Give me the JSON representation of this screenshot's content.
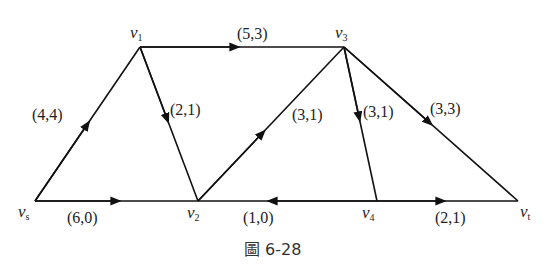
{
  "diagram": {
    "type": "network-flow",
    "caption": "圖 6-28",
    "nodes": [
      {
        "id": "vs",
        "name": "v",
        "sub": "s",
        "x": 35,
        "y": 201
      },
      {
        "id": "v1",
        "name": "v",
        "sub": "1",
        "x": 140,
        "y": 47
      },
      {
        "id": "v2",
        "name": "v",
        "sub": "2",
        "x": 198,
        "y": 201
      },
      {
        "id": "v3",
        "name": "v",
        "sub": "3",
        "x": 344,
        "y": 47
      },
      {
        "id": "v4",
        "name": "v",
        "sub": "4",
        "x": 377,
        "y": 201
      },
      {
        "id": "vt",
        "name": "v",
        "sub": "t",
        "x": 518,
        "y": 201
      }
    ],
    "edges": [
      {
        "from": "vs",
        "to": "v1",
        "label": "(4,4)"
      },
      {
        "from": "v1",
        "to": "v3",
        "label": "(5,3)"
      },
      {
        "from": "v1",
        "to": "v2",
        "label": "(2,1)"
      },
      {
        "from": "v2",
        "to": "v3",
        "label": "(3,1)"
      },
      {
        "from": "v3",
        "to": "v4",
        "label": "(3,1)"
      },
      {
        "from": "v3",
        "to": "vt",
        "label": "(3,3)"
      },
      {
        "from": "vs",
        "to": "v2",
        "label": "(6,0)"
      },
      {
        "from": "v4",
        "to": "v2",
        "label": "(1,0)"
      },
      {
        "from": "v4",
        "to": "vt",
        "label": "(2,1)"
      }
    ]
  }
}
